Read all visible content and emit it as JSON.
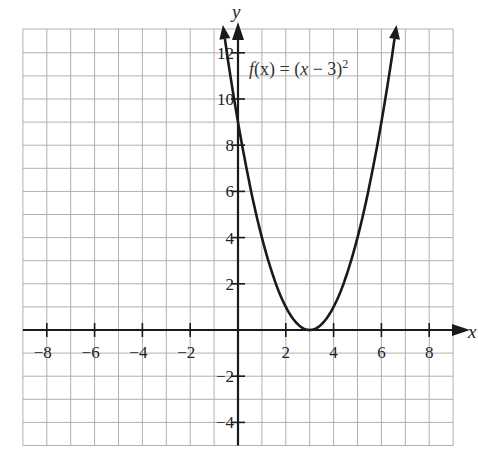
{
  "chart_data": {
    "type": "line",
    "title": "",
    "function_label": "f(x) = (x − 3)²",
    "function_label_parts": {
      "f": "f",
      "open": "(x) = (",
      "x": "x",
      "minus": " − 3)",
      "sup": "2"
    },
    "xlabel": "x",
    "ylabel": "y",
    "xlim": [
      -9,
      9
    ],
    "ylim": [
      -5,
      13
    ],
    "grid": true,
    "x_ticks": [
      -8,
      -6,
      -4,
      -2,
      2,
      4,
      6,
      8
    ],
    "x_tick_labels": [
      "−8",
      "−6",
      "−4",
      "−2",
      "2",
      "4",
      "6",
      "8"
    ],
    "y_ticks": [
      -4,
      -2,
      2,
      4,
      6,
      8,
      10,
      12
    ],
    "y_tick_labels": [
      "−4",
      "−2",
      "2",
      "4",
      "6",
      "8",
      "10",
      "12"
    ],
    "series": [
      {
        "name": "f(x) = (x − 3)²",
        "x": [
          -0.6,
          0,
          0.5,
          1,
          1.5,
          2,
          2.5,
          3,
          3.5,
          4,
          4.5,
          5,
          5.5,
          6,
          6.6
        ],
        "y": [
          12.96,
          9,
          6.25,
          4,
          2.25,
          1,
          0.25,
          0,
          0.25,
          1,
          2.25,
          4,
          6.25,
          9,
          12.96
        ]
      }
    ],
    "vertex": [
      3,
      0
    ],
    "colors": {
      "curve": "#1a1a1a",
      "axis": "#1a1a1a",
      "grid": "#b0b0b0"
    }
  }
}
